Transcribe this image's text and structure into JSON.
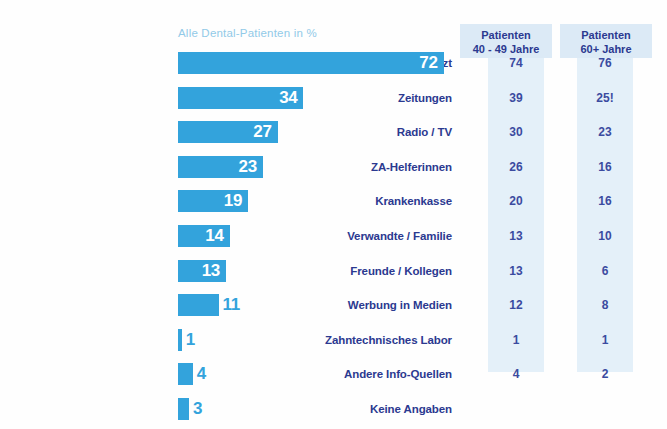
{
  "chart_data": {
    "type": "bar",
    "title": "",
    "series_caption": "Alle Dental-Patienten in %",
    "xlabel": "",
    "ylabel": "",
    "orientation": "horizontal",
    "xlim": [
      0,
      80
    ],
    "grid": false,
    "legend": "none",
    "categories": [
      "Zahnarzt",
      "Zeitungen",
      "Radio / TV",
      "ZA-Helferinnen",
      "Krankenkasse",
      "Verwandte / Familie",
      "Freunde / Kollegen",
      "Werbung in Medien",
      "Zahntechnisches Labor",
      "Andere Info-Quellen",
      "Keine Angaben"
    ],
    "values": [
      72,
      34,
      27,
      23,
      19,
      14,
      13,
      11,
      1,
      4,
      3
    ],
    "value_labels": [
      "72",
      "34",
      "27",
      "23",
      "19",
      "14",
      "13",
      "11",
      "1",
      "4",
      "3"
    ],
    "series": [
      {
        "name": "Alle Dental-Patienten in %",
        "values": [
          72,
          34,
          27,
          23,
          19,
          14,
          13,
          11,
          1,
          4,
          3
        ]
      },
      {
        "name": "Patienten 40 - 49 Jahre",
        "values": [
          74,
          39,
          30,
          26,
          20,
          13,
          13,
          12,
          1,
          4,
          null
        ]
      },
      {
        "name": "Patienten 60+ Jahre",
        "values": [
          76,
          25,
          23,
          16,
          16,
          10,
          6,
          8,
          1,
          2,
          null
        ]
      }
    ]
  },
  "columns": [
    {
      "header_line1": "Patienten",
      "header_line2": "40 - 49 Jahre",
      "cells": [
        "74",
        "39",
        "30",
        "26",
        "20",
        "13",
        "13",
        "12",
        "1",
        "4",
        ""
      ]
    },
    {
      "header_line1": "Patienten",
      "header_line2": "60+ Jahre",
      "cells": [
        "76",
        "25!",
        "23",
        "16",
        "16",
        "10",
        "6",
        "8",
        "1",
        "2",
        ""
      ]
    }
  ],
  "colors": {
    "bar": "#33a3dc",
    "label_text": "#2b3990",
    "caption": "#92cae8",
    "column_bg": "#e4f0f9",
    "column_header_bg": "#dceaf6",
    "column_text": "#3b4ba0",
    "background": "#ffffff"
  }
}
